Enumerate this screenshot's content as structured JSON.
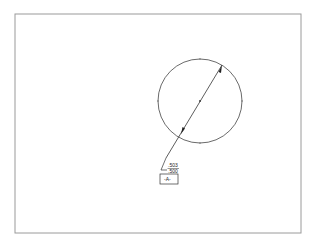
{
  "drawing": {
    "frame": {
      "x1": 15,
      "y1": 14,
      "x2": 301,
      "y2": 233,
      "color": "#999999"
    },
    "circle": {
      "cx": 200,
      "cy": 101,
      "r": 42
    },
    "dimension": {
      "upper_limit": ".503",
      "lower_limit": ".500"
    },
    "datum": {
      "label": "-A-"
    }
  }
}
